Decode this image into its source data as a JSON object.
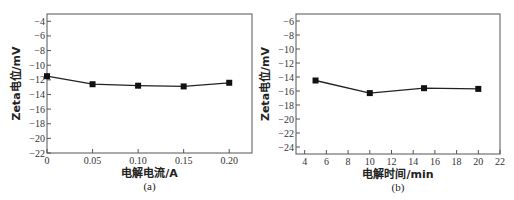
{
  "chart_data": [
    {
      "id": "a",
      "type": "line",
      "title": "",
      "panel_label": "(a)",
      "xlabel": "电解电流/A",
      "ylabel": "Zeta电位/mV",
      "x": [
        0,
        0.05,
        0.1,
        0.15,
        0.2
      ],
      "series": [
        {
          "name": "Zeta电位",
          "values": [
            -11.5,
            -12.6,
            -12.8,
            -12.9,
            -12.4
          ],
          "marker": "square"
        }
      ],
      "xlim": [
        0,
        0.225
      ],
      "ylim": [
        -22,
        -3
      ],
      "xticks": [
        0,
        0.05,
        0.1,
        0.15,
        0.2
      ],
      "xtick_labels": [
        "0",
        "0.05",
        "0.10",
        "0.15",
        "0.20"
      ],
      "yticks": [
        -4,
        -6,
        -8,
        -10,
        -12,
        -14,
        -16,
        -18,
        -20,
        -22
      ],
      "ytick_labels": [
        "−4",
        "−6",
        "−8",
        "−10",
        "−12",
        "−14",
        "−16",
        "−18",
        "−20",
        "−22"
      ],
      "grid": false,
      "legend": "none"
    },
    {
      "id": "b",
      "type": "line",
      "title": "",
      "panel_label": "(b)",
      "xlabel": "电解时间/min",
      "ylabel": "Zeta电位/mV",
      "x": [
        5,
        10,
        15,
        20
      ],
      "series": [
        {
          "name": "Zeta电位",
          "values": [
            -14.5,
            -16.3,
            -15.6,
            -15.7
          ],
          "marker": "square"
        }
      ],
      "xlim": [
        3.2,
        22
      ],
      "ylim": [
        -25,
        -5
      ],
      "xticks": [
        4,
        6,
        8,
        10,
        12,
        14,
        16,
        18,
        20,
        22
      ],
      "xtick_labels": [
        "4",
        "6",
        "8",
        "10",
        "12",
        "14",
        "16",
        "18",
        "20",
        "22"
      ],
      "yticks": [
        -6,
        -8,
        -10,
        -12,
        -14,
        -16,
        -18,
        -20,
        -22,
        -24
      ],
      "ytick_labels": [
        "−6",
        "−8",
        "−10",
        "−12",
        "−14",
        "−16",
        "−18",
        "−20",
        "−22",
        "−24"
      ],
      "grid": false,
      "legend": "none"
    }
  ],
  "colors": {
    "line": "#222222",
    "marker": "#111111",
    "frame": "#555555"
  }
}
